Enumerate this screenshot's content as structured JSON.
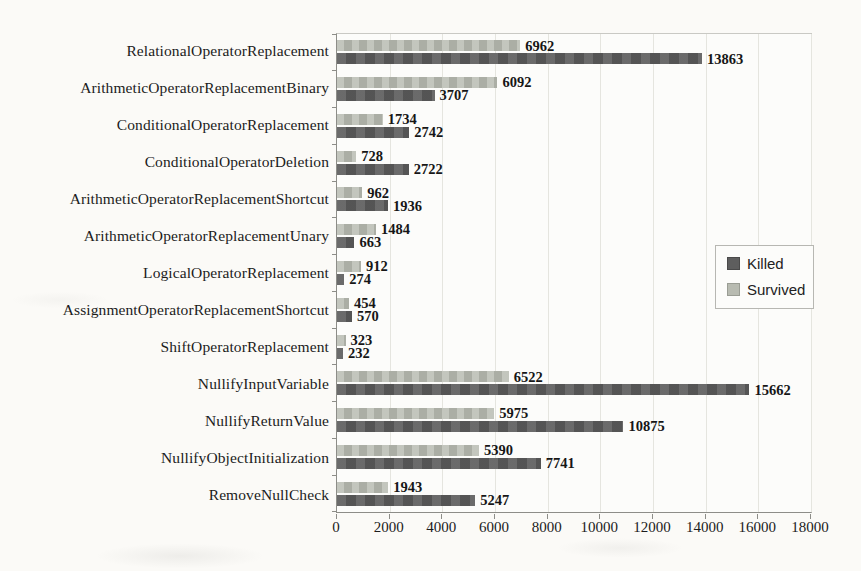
{
  "chart_data": {
    "type": "bar",
    "orientation": "horizontal",
    "title": "",
    "xlabel": "",
    "ylabel": "",
    "categories": [
      "RelationalOperatorReplacement",
      "ArithmeticOperatorReplacementBinary",
      "ConditionalOperatorReplacement",
      "ConditionalOperatorDeletion",
      "ArithmeticOperatorReplacementShortcut",
      "ArithmeticOperatorReplacementUnary",
      "LogicalOperatorReplacement",
      "AssignmentOperatorReplacementShortcut",
      "ShiftOperatorReplacement",
      "NullifyInputVariable",
      "NullifyReturnValue",
      "NullifyObjectInitialization",
      "RemoveNullCheck"
    ],
    "series": [
      {
        "name": "Killed",
        "color": "#5e5e5e",
        "values": [
          13863,
          3707,
          2742,
          2722,
          1936,
          663,
          274,
          570,
          232,
          15662,
          10875,
          7741,
          5247
        ]
      },
      {
        "name": "Survived",
        "color": "#b8bbb1",
        "values": [
          6962,
          6092,
          1734,
          728,
          962,
          1484,
          912,
          454,
          323,
          6522,
          5975,
          5390,
          1943
        ]
      }
    ],
    "bar_order_within_group_top_to_bottom": [
      "Survived",
      "Killed"
    ],
    "value_labels": true,
    "xlim": [
      0,
      18000
    ],
    "xticks": [
      0,
      2000,
      4000,
      6000,
      8000,
      10000,
      12000,
      14000,
      16000,
      18000
    ],
    "grid": "vertical",
    "legend_position": "right-center-inside"
  }
}
